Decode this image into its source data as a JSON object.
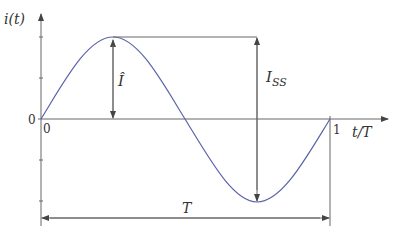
{
  "diagram": {
    "y_axis_label": "i(t)",
    "x_axis_label": "t/T",
    "y_origin_label": "0",
    "x_origin_label": "0",
    "x_end_label": "1",
    "peak_label": "Î",
    "peak_to_peak_label": "I",
    "peak_to_peak_subscript": "SS",
    "period_label": "T",
    "colors": {
      "curve": "#5b63a8",
      "axes": "#666666",
      "text": "#333333"
    }
  }
}
